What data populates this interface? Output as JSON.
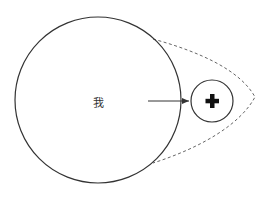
{
  "diagram": {
    "large_circle": {
      "label": "我",
      "cx": 98,
      "cy": 100,
      "r": 83
    },
    "small_circle": {
      "symbol": "plus-icon",
      "glyph": "✚",
      "cx": 212,
      "cy": 101,
      "r": 21
    },
    "arrow": {
      "from": [
        148,
        101
      ],
      "to": [
        189,
        101
      ]
    },
    "dashed_outline": {
      "style": "dashed",
      "color": "#666666"
    },
    "colors": {
      "stroke": "#333333",
      "background": "#ffffff"
    }
  }
}
